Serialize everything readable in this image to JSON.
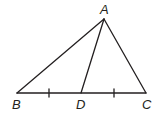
{
  "diagram": {
    "type": "triangle",
    "points": {
      "A": {
        "label": "A",
        "x": 104,
        "y": 19
      },
      "B": {
        "label": "B",
        "x": 17,
        "y": 93
      },
      "C": {
        "label": "C",
        "x": 146,
        "y": 93
      },
      "D": {
        "label": "D",
        "x": 81,
        "y": 93
      }
    },
    "segments": [
      "AB",
      "AC",
      "BC",
      "AD"
    ],
    "congruence_marks": [
      {
        "segment": "BD",
        "ticks": 1
      },
      {
        "segment": "DC",
        "ticks": 1
      }
    ],
    "colors": {
      "stroke": "#231f20",
      "background": "#ffffff"
    }
  }
}
